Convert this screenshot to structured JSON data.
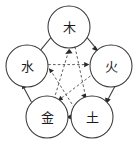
{
  "diagram": {
    "background_color": "#ffffff",
    "stroke_color": "#3a3a3a",
    "label_color": "#1c1c1c",
    "nodes": [
      {
        "id": "wood",
        "label": "木",
        "position": "top",
        "cx": 69,
        "cy": 27,
        "r": 21
      },
      {
        "id": "water",
        "label": "水",
        "position": "left",
        "cx": 27,
        "cy": 66,
        "r": 21
      },
      {
        "id": "fire",
        "label": "火",
        "position": "right",
        "cx": 111,
        "cy": 66,
        "r": 21
      },
      {
        "id": "metal",
        "label": "金",
        "position": "bottom-left",
        "cx": 47,
        "cy": 117,
        "r": 21
      },
      {
        "id": "earth",
        "label": "土",
        "position": "bottom-right",
        "cx": 92,
        "cy": 117,
        "r": 21
      }
    ],
    "generating_cycle": {
      "name": "sheng",
      "style": "solid",
      "edges": [
        {
          "from": "water",
          "to": "wood"
        },
        {
          "from": "wood",
          "to": "fire"
        },
        {
          "from": "fire",
          "to": "earth"
        },
        {
          "from": "earth",
          "to": "metal"
        },
        {
          "from": "metal",
          "to": "water"
        }
      ]
    },
    "overcoming_cycle": {
      "name": "ke",
      "style": "dashed",
      "edges": [
        {
          "from": "wood",
          "to": "earth"
        },
        {
          "from": "earth",
          "to": "water"
        },
        {
          "from": "water",
          "to": "fire"
        },
        {
          "from": "fire",
          "to": "metal"
        },
        {
          "from": "metal",
          "to": "wood"
        }
      ]
    }
  }
}
